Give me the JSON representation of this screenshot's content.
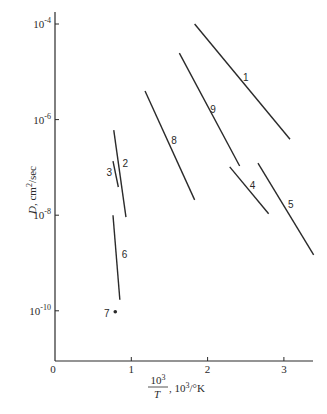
{
  "chart_data": {
    "type": "line",
    "title": "",
    "xlabel": "10^3/T, 10^3/°K",
    "xlabel_parts": {
      "num": "10",
      "num_sup": "3",
      "den": "T",
      "rest": ", 10",
      "rest_sup": "3",
      "unit": "/°K"
    },
    "ylabel": "D, cm²/sec",
    "ylabel_parts": {
      "main": "D",
      "sep": ", ",
      "unit": "cm",
      "unit_sup": "2",
      "unit_rest": "/sec"
    },
    "yscale": "log",
    "xlim": [
      0,
      3.4
    ],
    "ylim_log10": [
      -11,
      -3.75
    ],
    "grid": false,
    "x_ticks": [
      {
        "value": 0,
        "label": "0"
      },
      {
        "value": 1,
        "label": "1"
      },
      {
        "value": 2,
        "label": "2"
      },
      {
        "value": 3,
        "label": "3"
      }
    ],
    "y_ticks": [
      {
        "log10": -4,
        "base": "10",
        "exp": "-4"
      },
      {
        "log10": -6,
        "base": "10",
        "exp": "-6"
      },
      {
        "log10": -8,
        "base": "10",
        "exp": "-8"
      },
      {
        "log10": -10,
        "base": "10",
        "exp": "-10"
      }
    ],
    "series": [
      {
        "name": "1",
        "x": [
          1.83,
          3.08
        ],
        "log10_D": [
          -4.0,
          -6.41
        ],
        "label_at": [
          2.5,
          -5.1
        ]
      },
      {
        "name": "2",
        "x": [
          0.77,
          0.93
        ],
        "log10_D": [
          -6.22,
          -8.04
        ],
        "label_at": [
          0.92,
          -6.9
        ]
      },
      {
        "name": "3",
        "x": [
          0.76,
          0.83
        ],
        "log10_D": [
          -6.87,
          -7.41
        ],
        "label_at": [
          0.71,
          -7.1
        ]
      },
      {
        "name": "4",
        "x": [
          2.29,
          2.8
        ],
        "log10_D": [
          -6.99,
          -7.97
        ],
        "label_at": [
          2.59,
          -7.36
        ]
      },
      {
        "name": "5",
        "x": [
          2.66,
          3.39
        ],
        "log10_D": [
          -6.91,
          -8.83
        ],
        "label_at": [
          3.09,
          -7.77
        ]
      },
      {
        "name": "6",
        "x": [
          0.76,
          0.85
        ],
        "log10_D": [
          -8.0,
          -9.77
        ],
        "label_at": [
          0.91,
          -8.81
        ]
      },
      {
        "name": "7",
        "x": [
          0.79
        ],
        "log10_D": [
          -10.02
        ],
        "marker": "point",
        "label_at": [
          0.68,
          -10.04
        ]
      },
      {
        "name": "8",
        "x": [
          1.18,
          1.83
        ],
        "log10_D": [
          -5.4,
          -7.68
        ],
        "label_at": [
          1.56,
          -6.43
        ]
      },
      {
        "name": "9",
        "x": [
          1.63,
          2.42
        ],
        "log10_D": [
          -4.61,
          -6.97
        ],
        "label_at": [
          2.07,
          -5.78
        ]
      }
    ]
  }
}
